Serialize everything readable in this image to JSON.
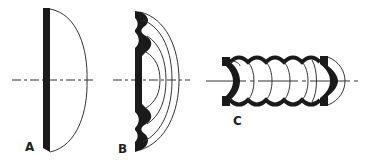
{
  "figure": {
    "panels": [
      {
        "id": "A",
        "label": "A",
        "description": "plano-convex lens with flat dark backing"
      },
      {
        "id": "B",
        "label": "B",
        "description": "stepped (corrugated) lens with concentric arcs"
      },
      {
        "id": "C",
        "label": "C",
        "description": "cylindrical bellows with end lenses"
      }
    ],
    "colors": {
      "ink": "#1a1a1a",
      "background": "#ffffff"
    }
  }
}
